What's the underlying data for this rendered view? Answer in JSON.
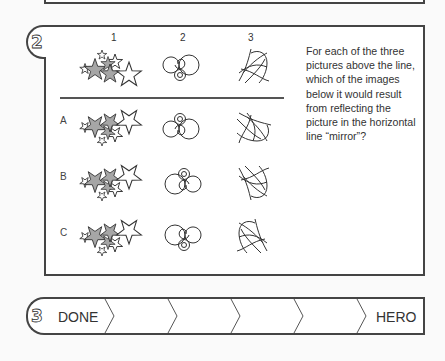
{
  "worksheet": {
    "section2": {
      "number": "2",
      "column_labels": [
        "1",
        "2",
        "3"
      ],
      "row_labels": [
        "A",
        "B",
        "C"
      ],
      "question": "For each of the three pictures above the line, which of the images below it would result from reflecting the picture in the horizontal line “mirror”?",
      "figures": [
        "star-cluster",
        "spiral-circles",
        "crossing-curves"
      ]
    },
    "section3": {
      "number": "3",
      "progress_start_label": "DONE",
      "progress_end_label": "HERO",
      "step_count": 6
    },
    "colors": {
      "border": "#444444",
      "star_fill": "#a6a6a6",
      "page": "#fafafa"
    }
  }
}
